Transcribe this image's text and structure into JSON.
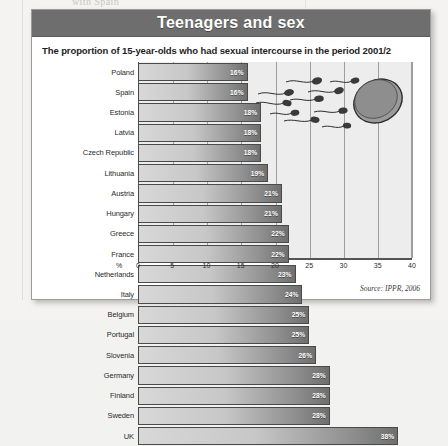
{
  "bleed_text": "with Spain",
  "figure": {
    "title": "Teenagers and sex",
    "subtitle": "The proportion of 15-year-olds who had sexual intercourse in the period 2001/2",
    "source": "Source: IPPR, 2006",
    "percent_axis_label": "%",
    "illustration_name": "sperm-and-egg-illustration"
  },
  "colors": {
    "title_bar": "#6e6e6e",
    "plot_background": "#ededed",
    "bar_light": "#d8d8d8",
    "bar_dark": "#6f6f6f",
    "frame_border": "#9d9c99"
  },
  "chart_data": {
    "type": "bar",
    "orientation": "horizontal",
    "title": "Teenagers and sex",
    "subtitle": "The proportion of 15-year-olds who had sexual intercourse in the period 2001/2",
    "xlabel": "%",
    "ylabel": "",
    "xlim": [
      0,
      40
    ],
    "xticks": [
      0,
      5,
      10,
      15,
      20,
      25,
      30,
      35,
      40
    ],
    "grid": true,
    "legend": false,
    "value_suffix": "%",
    "source": "Source: IPPR, 2006",
    "categories": [
      "Poland",
      "Spain",
      "Estonia",
      "Latvia",
      "Czech Republic",
      "Lithuania",
      "Austria",
      "Hungary",
      "Greece",
      "France",
      "Netherlands",
      "Italy",
      "Belgium",
      "Portugal",
      "Slovenia",
      "Germany",
      "Finland",
      "Sweden",
      "UK"
    ],
    "values": [
      16,
      16,
      18,
      18,
      18,
      19,
      21,
      21,
      22,
      22,
      23,
      24,
      25,
      25,
      26,
      28,
      28,
      28,
      38
    ],
    "labels": [
      "16%",
      "16%",
      "18%",
      "18%",
      "18%",
      "19%",
      "21%",
      "21%",
      "22%",
      "22%",
      "23%",
      "24%",
      "25%",
      "25%",
      "26%",
      "28%",
      "28%",
      "28%",
      "38%"
    ]
  }
}
